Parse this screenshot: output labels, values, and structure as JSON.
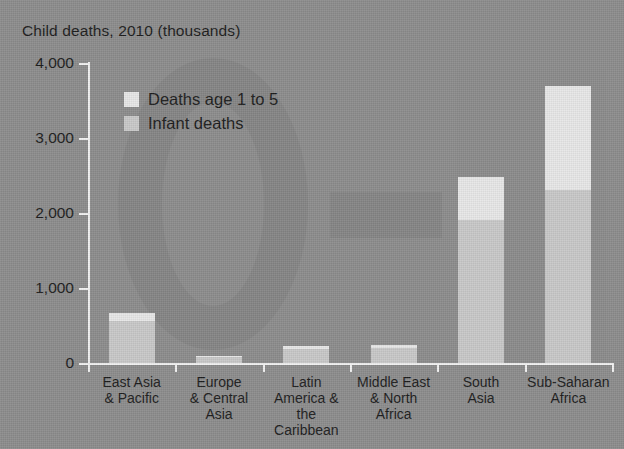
{
  "axis_title": "Child deaths, 2010 (thousands)",
  "cut_title": "",
  "legend": {
    "items": [
      {
        "label": "Deaths age 1 to 5",
        "color": "#e8e8e8"
      },
      {
        "label": "Infant deaths",
        "color": "#c9c9c9"
      }
    ]
  },
  "colors": {
    "background": "#8d8d8d",
    "axis": "#f2f2f2",
    "text": "#1c1c1c",
    "deaths_1_to_5": "#e8e8e8",
    "infant_deaths": "#c9c9c9"
  },
  "chart_data": {
    "type": "bar",
    "title": "Child deaths, 2010 (thousands)",
    "subtitle": "",
    "xlabel": "",
    "ylabel": "Child deaths, 2010 (thousands)",
    "ylim": [
      0,
      4000
    ],
    "yticks": [
      0,
      1000,
      2000,
      3000,
      4000
    ],
    "ytick_labels": [
      "0",
      "1,000",
      "2,000",
      "3,000",
      "4,000"
    ],
    "grid": false,
    "stacked": true,
    "legend_position": "inside-upper-left",
    "categories": [
      "East Asia & Pacific",
      "Europe & Central Asia",
      "Latin America & the Caribbean",
      "Middle East & North Africa",
      "South Asia",
      "Sub-Saharan Africa"
    ],
    "category_lines": [
      [
        "East Asia",
        "& Pacific"
      ],
      [
        "Europe",
        "& Central",
        "Asia"
      ],
      [
        "Latin",
        "America &",
        "the Caribbean"
      ],
      [
        "Middle East",
        "& North",
        "Africa"
      ],
      [
        "South",
        "Asia"
      ],
      [
        "Sub-Saharan",
        "Africa"
      ]
    ],
    "series": [
      {
        "name": "Infant deaths",
        "color": "#c9c9c9",
        "values": [
          560,
          80,
          185,
          205,
          1905,
          2310
        ]
      },
      {
        "name": "Deaths age 1 to 5",
        "color": "#e8e8e8",
        "values": [
          107,
          15,
          40,
          35,
          575,
          1390
        ]
      }
    ],
    "totals": [
      667,
      95,
      225,
      240,
      2480,
      3700
    ]
  }
}
